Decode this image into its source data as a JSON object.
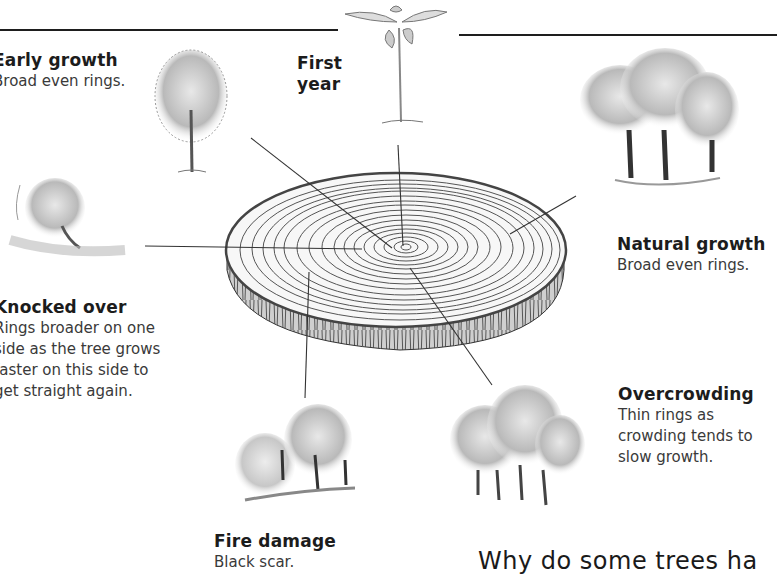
{
  "diagram": {
    "center": "tree-ring-cross-section",
    "labels": {
      "first_year": {
        "title": "First\nyear",
        "title_line1": "First",
        "title_line2": "year"
      },
      "early_growth": {
        "title": "Early growth",
        "desc": "Broad even rings."
      },
      "natural_growth": {
        "title": "Natural growth",
        "desc": "Broad even rings."
      },
      "knocked_over": {
        "title": "Knocked over",
        "desc_lines": [
          "Rings broader on one",
          "side as the tree grows",
          "faster on this side to",
          "get straight again."
        ]
      },
      "overcrowding": {
        "title": "Overcrowding",
        "desc_lines": [
          "Thin rings as",
          "crowding tends to",
          "slow growth."
        ]
      },
      "fire_damage": {
        "title": "Fire damage",
        "desc": "Black scar."
      }
    },
    "illustrations": [
      "seedling",
      "young-tree",
      "mature-trees",
      "leaning-tree",
      "burnt-woodland",
      "crowded-trees"
    ],
    "section_heading": "Why do some trees ha"
  },
  "colors": {
    "ink": "#1c1c1c",
    "text": "#3a3a3a",
    "background": "#ffffff"
  }
}
